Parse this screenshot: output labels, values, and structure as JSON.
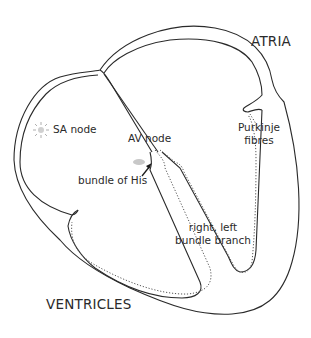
{
  "diagram": {
    "labels": {
      "atria": "ATRIA",
      "ventricles": "VENTRICLES",
      "sa_node": "SA node",
      "av_node": "AV node",
      "bundle_of_his": "bundle of His",
      "purkinje_line1": "Purkinje",
      "purkinje_line2": "fibres",
      "bundle_branch_line1": "right, left",
      "bundle_branch_line2": "bundle branch"
    },
    "colors": {
      "outline": "#2a2a2a",
      "dotted": "#555555",
      "node_fill": "#c8c8c8",
      "text": "#2a2a2a"
    }
  }
}
